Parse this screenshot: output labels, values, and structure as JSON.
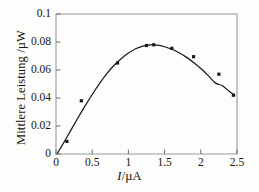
{
  "chart_data": {
    "type": "line",
    "title": "",
    "subtitle": "",
    "xlabel": "I/µA",
    "xlabel_italic_part": "I",
    "xlabel_rest": "/µA",
    "ylabel": "Mittlere Leistung /µW",
    "xlim": [
      0,
      2.5
    ],
    "ylim": [
      0,
      0.1
    ],
    "xticks": [
      0,
      0.5,
      1,
      1.5,
      2,
      2.5
    ],
    "xticklabels": [
      "0",
      "0.5",
      "1",
      "1.5",
      "2",
      "2.5"
    ],
    "yticks": [
      0,
      0.02,
      0.04,
      0.06,
      0.08,
      0.1
    ],
    "yticklabels": [
      "0",
      "0.02",
      "0.04",
      "0.06",
      "0.08",
      "0.1"
    ],
    "grid": false,
    "legend": false,
    "legend_position": "none",
    "series": [
      {
        "name": "Mittlere Leistung",
        "marker": "square",
        "line_style": "solid",
        "color": "#1a1a1a",
        "x": [
          0.15,
          0.35,
          0.85,
          1.25,
          1.35,
          1.6,
          1.9,
          2.25,
          2.45
        ],
        "y": [
          0.009,
          0.038,
          0.065,
          0.0775,
          0.078,
          0.0755,
          0.0695,
          0.057,
          0.042
        ]
      }
    ],
    "curve": {
      "description": "smooth fitted curve through data points, rising from origin to a broad maximum near I = 1.3 uA and falling thereafter",
      "x": [
        0.02,
        0.1,
        0.2,
        0.3,
        0.4,
        0.5,
        0.6,
        0.7,
        0.8,
        0.9,
        1.0,
        1.1,
        1.2,
        1.3,
        1.4,
        1.5,
        1.6,
        1.7,
        1.8,
        1.9,
        2.0,
        2.1,
        2.2,
        2.3,
        2.4,
        2.47
      ],
      "y": [
        0.0005,
        0.0075,
        0.0165,
        0.0255,
        0.0342,
        0.0425,
        0.0503,
        0.0573,
        0.0632,
        0.0681,
        0.0721,
        0.0752,
        0.0771,
        0.0779,
        0.0777,
        0.0766,
        0.0748,
        0.0723,
        0.0692,
        0.0654,
        0.0611,
        0.0562,
        0.0508,
        0.0487,
        0.0444,
        0.0418
      ]
    }
  },
  "axes": {
    "frame_color": "#9a9a9a",
    "tick_color": "#6f6f6f",
    "data_color": "#1a1a1a"
  }
}
